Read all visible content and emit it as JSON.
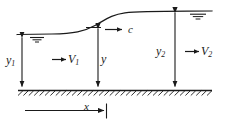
{
  "figure": {
    "stroke_color": "#1a1a1a",
    "background_color": "#ffffff",
    "labels": {
      "depth_upstream": {
        "symbol": "y",
        "subscript": "1"
      },
      "velocity_upstream": {
        "symbol": "V",
        "subscript": "1"
      },
      "celerity": {
        "symbol": "c",
        "subscript": ""
      },
      "depth_wave_front": {
        "symbol": "y",
        "subscript": ""
      },
      "depth_downstream": {
        "symbol": "y",
        "subscript": "2"
      },
      "velocity_downstream": {
        "symbol": "V",
        "subscript": "2"
      },
      "distance": {
        "symbol": "x",
        "subscript": ""
      }
    },
    "icons": {
      "water_surface_left": "water-level-symbol",
      "water_surface_right": "water-level-symbol",
      "flow_arrow_upstream": "right-arrow-icon",
      "flow_arrow_downstream": "right-arrow-icon",
      "celerity_arrow": "right-arrow-icon",
      "channel_bed": "hatched-ground-icon"
    }
  }
}
